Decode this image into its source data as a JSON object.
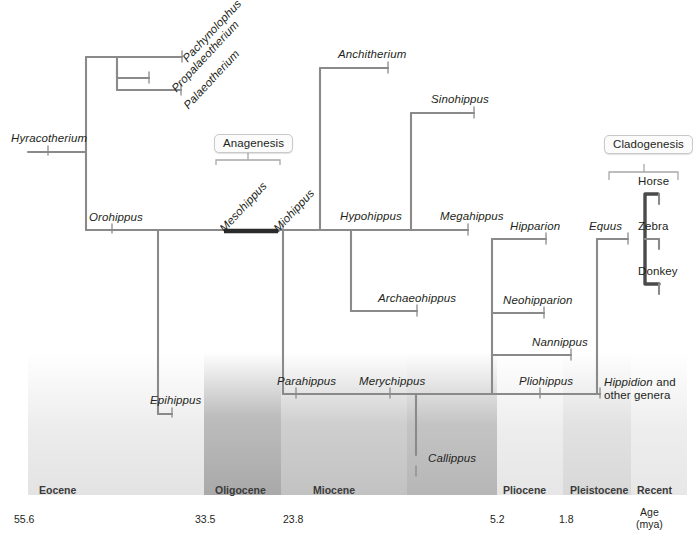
{
  "figure": {
    "type": "phylogenetic-tree"
  },
  "events": {
    "anagenesis": "Anagenesis",
    "cladogenesis": "Cladogenesis"
  },
  "taxa": {
    "hyracotherium": "Hyracotherium",
    "pachynolophus": "Pachynolophus",
    "propalaeotherium": "Propalaeotherium",
    "palaeotherium": "Palaeotherium",
    "orohippus": "Orohippus",
    "epihippus": "Epihippus",
    "mesohippus": "Mesohippus",
    "miohippus": "Miohippus",
    "anchitherium": "Anchitherium",
    "sinohippus": "Sinohippus",
    "hypohippus": "Hypohippus",
    "megahippus": "Megahippus",
    "archaeohippus": "Archaeohippus",
    "parahippus": "Parahippus",
    "merychippus": "Merychippus",
    "callippus": "Callippus",
    "hipparion": "Hipparion",
    "neohipparion": "Neohipparion",
    "nannippus": "Nannippus",
    "pliohippus": "Pliohippus",
    "hippidion_line1": "Hippidion",
    "hippidion_line2": " and other genera",
    "equus": "Equus",
    "horse": "Horse",
    "zebra": "Zebra",
    "donkey": "Donkey"
  },
  "timescale": {
    "epochs": [
      {
        "name": "Eocene",
        "start_mya": 55.6,
        "end_mya": 33.5
      },
      {
        "name": "Oligocene",
        "start_mya": 33.5,
        "end_mya": 23.8
      },
      {
        "name": "Miocene",
        "start_mya": 23.8,
        "end_mya": 5.2
      },
      {
        "name": "Pliocene",
        "start_mya": 5.2,
        "end_mya": 1.8
      },
      {
        "name": "Pleistocene",
        "start_mya": 1.8,
        "end_mya": 0.01
      },
      {
        "name": "Recent",
        "start_mya": 0.01,
        "end_mya": 0
      }
    ],
    "tick_labels": [
      "55.6",
      "33.5",
      "23.8",
      "5.2",
      "1.8"
    ],
    "axis_label_line1": "Age",
    "axis_label_line2": "(mya)"
  },
  "colors": {
    "branch": "#8a8a8a",
    "highlight": "#2b2b2b",
    "text": "#231f20",
    "band_light": "#e4e4e4",
    "band_dark": "#adadad",
    "band_mid": "#c6c6c6",
    "box_border": "#c9c9c9",
    "box_fill": "#fbfbfb"
  }
}
